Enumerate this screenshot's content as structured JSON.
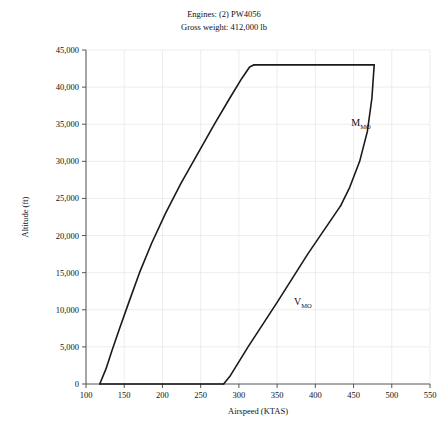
{
  "chart_data": {
    "type": "line",
    "title": "",
    "subtitle_lines": [
      "Engines: (2) PW4056",
      "Gross weight: 412,000 lb"
    ],
    "xlabel": "Airspeed (KTAS)",
    "ylabel": "Altitude (ft)",
    "xlim": [
      100,
      550
    ],
    "ylim": [
      0,
      45000
    ],
    "xticks": [
      100,
      150,
      200,
      250,
      300,
      350,
      400,
      450,
      500,
      550
    ],
    "xtick_labels": [
      "100",
      "150",
      "200",
      "250",
      "300",
      "350",
      "400",
      "450",
      "500",
      "550"
    ],
    "yticks": [
      0,
      5000,
      10000,
      15000,
      20000,
      25000,
      30000,
      35000,
      40000,
      45000
    ],
    "ytick_labels": [
      "0",
      "5,000",
      "10,000",
      "15,000",
      "20,000",
      "25,000",
      "30,000",
      "35,000",
      "40,000",
      "45,000"
    ],
    "grid": true,
    "legend": "none",
    "line_color": "#1a1a1a",
    "grid_color": "#e8e8e8",
    "axis_color": "#555555",
    "series": [
      {
        "name": "Stall boundary (low-speed limit)",
        "points": [
          [
            118,
            0
          ],
          [
            126,
            2000
          ],
          [
            134,
            4500
          ],
          [
            144,
            7500
          ],
          [
            156,
            11000
          ],
          [
            170,
            15000
          ],
          [
            186,
            19000
          ],
          [
            204,
            23000
          ],
          [
            224,
            27000
          ],
          [
            246,
            31000
          ],
          [
            268,
            35000
          ],
          [
            288,
            38500
          ],
          [
            304,
            41200
          ],
          [
            314,
            42700
          ],
          [
            320,
            43000
          ]
        ]
      },
      {
        "name": "Service ceiling (upper limit)",
        "points": [
          [
            320,
            43000
          ],
          [
            477,
            43000
          ]
        ]
      },
      {
        "name": "M_MO boundary (Mach limit)",
        "points": [
          [
            477,
            43000
          ],
          [
            474,
            38500
          ],
          [
            468,
            34000
          ],
          [
            458,
            30000
          ],
          [
            445,
            26500
          ],
          [
            433,
            24000
          ]
        ]
      },
      {
        "name": "V_MO boundary (airspeed limit)",
        "points": [
          [
            433,
            24000
          ],
          [
            390,
            17500
          ],
          [
            350,
            11000
          ],
          [
            312,
            5000
          ],
          [
            288,
            1000
          ],
          [
            280,
            0
          ]
        ]
      },
      {
        "name": "Sea-level baseline",
        "points": [
          [
            118,
            0
          ],
          [
            280,
            0
          ]
        ]
      }
    ],
    "annotations": [
      {
        "name": "mach-limit-label",
        "base": "M",
        "subscript": "MO",
        "x": 447,
        "y": 34800
      },
      {
        "name": "airspeed-limit-label",
        "base": "V",
        "subscript": "MO",
        "x": 372,
        "y": 10600
      }
    ]
  }
}
